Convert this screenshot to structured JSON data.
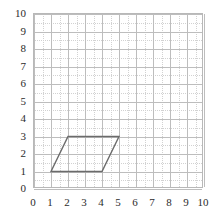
{
  "chart_data": {
    "type": "scatter",
    "title": "",
    "xlabel": "",
    "ylabel": "",
    "xlim": [
      0,
      10
    ],
    "ylim": [
      0,
      10
    ],
    "grid": true,
    "grid_major_step": 1,
    "grid_minor_step": 0.5,
    "legend": "none",
    "x_ticks": [
      "0",
      "1",
      "2",
      "3",
      "4",
      "5",
      "6",
      "7",
      "8",
      "9",
      "10"
    ],
    "y_ticks": [
      "0",
      "1",
      "2",
      "3",
      "4",
      "5",
      "6",
      "7",
      "8",
      "9",
      "10"
    ],
    "shapes": [
      {
        "name": "parallelogram",
        "kind": "polygon",
        "closed": true,
        "stroke": "#6b6b6b",
        "fill": "none",
        "stroke_width": 1.4,
        "vertices": [
          {
            "x": 1,
            "y": 1
          },
          {
            "x": 4,
            "y": 1
          },
          {
            "x": 5,
            "y": 3
          },
          {
            "x": 2,
            "y": 3
          }
        ]
      }
    ]
  },
  "colors": {
    "background": "#ffffff",
    "grid_major": "#bdbdbd",
    "grid_minor": "#d2d2d2",
    "plot_border": "#b8b8b8",
    "shape_stroke": "#6b6b6b",
    "tick_text": "#2b2b2b"
  }
}
